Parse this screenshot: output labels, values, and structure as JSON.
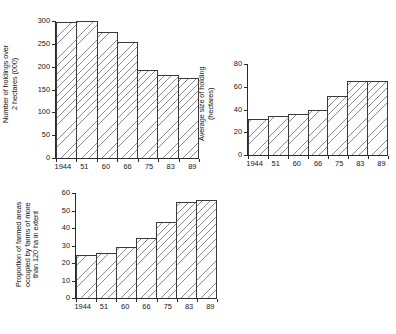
{
  "figure": {
    "background_color": "#ffffff",
    "bar_fill_color": "#fdfdfd",
    "bar_edge_color": "#3a3a3a",
    "hatch": "diagonal-lines"
  },
  "chart_data": [
    {
      "id": "holdings",
      "type": "bar",
      "title": "",
      "xlabel": "",
      "ylabel": "Number of holdings over\n2 hectares (000)",
      "categories": [
        "1944",
        "51",
        "60",
        "66",
        "75",
        "83",
        "89"
      ],
      "values": [
        297,
        300,
        277,
        255,
        193,
        181,
        176
      ],
      "ylim": [
        0,
        300
      ],
      "yticks": [
        0,
        50,
        100,
        150,
        200,
        250,
        300
      ],
      "ytick_labels": [
        "0",
        "50",
        "100",
        "150",
        "200",
        "250",
        "300"
      ],
      "grid": false,
      "legend": "none"
    },
    {
      "id": "average-size",
      "type": "bar",
      "title": "",
      "xlabel": "",
      "ylabel": "Average size of holding\n(hectares)",
      "categories": [
        "1944",
        "51",
        "60",
        "66",
        "75",
        "83",
        "89"
      ],
      "values": [
        32,
        34,
        36,
        40,
        52,
        65,
        65
      ],
      "ylim": [
        0,
        80
      ],
      "yticks": [
        0,
        20,
        40,
        60,
        80
      ],
      "ytick_labels": [
        "0",
        "20",
        "40",
        "60",
        "80"
      ],
      "grid": false,
      "legend": "none"
    },
    {
      "id": "proportion-large-farms",
      "type": "bar",
      "title": "",
      "xlabel": "",
      "ylabel": "Proportion of farmed areas\noccupied by farms of more\nthan 120 ha in extent",
      "categories": [
        "1944",
        "51",
        "60",
        "66",
        "75",
        "83",
        "89"
      ],
      "values": [
        24.5,
        26,
        29,
        34.5,
        43.5,
        55,
        56
      ],
      "ylim": [
        0,
        60
      ],
      "yticks": [
        0,
        10,
        20,
        30,
        40,
        50,
        60
      ],
      "ytick_labels": [
        "0",
        "10",
        "20",
        "30",
        "40",
        "50",
        "60"
      ],
      "grid": false,
      "legend": "none"
    }
  ]
}
